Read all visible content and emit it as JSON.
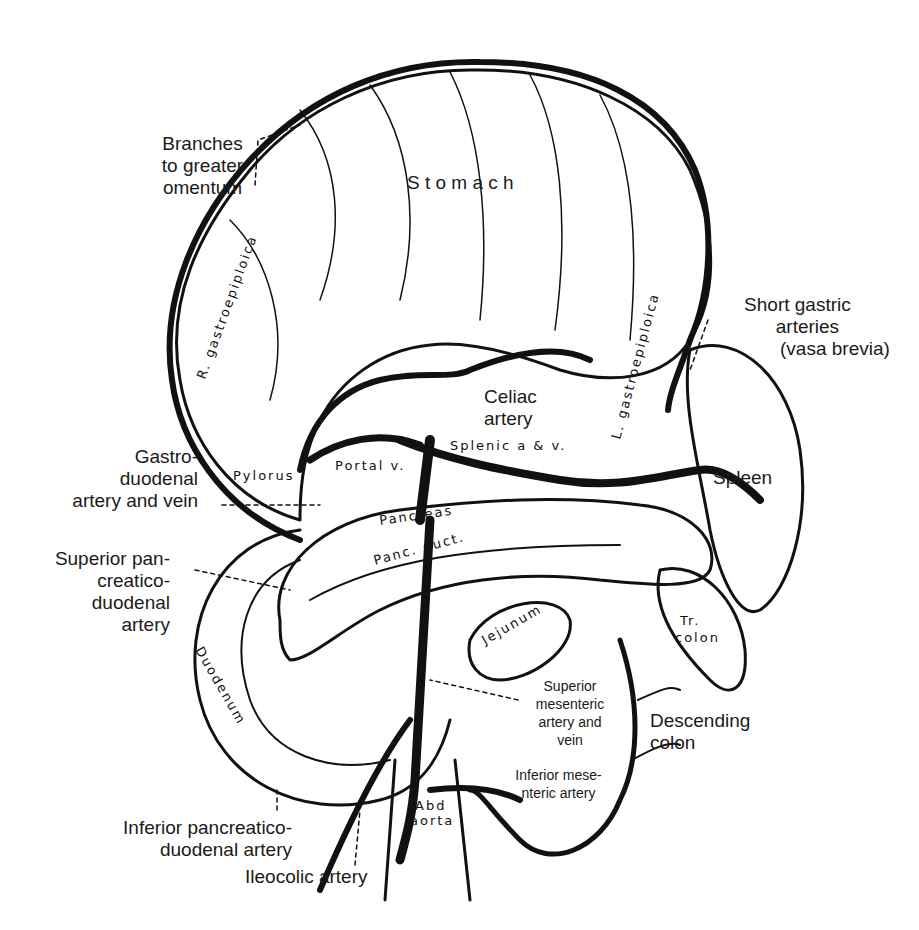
{
  "figure": {
    "type": "anatomical illustration"
  },
  "labels": {
    "stomach": "S t o m a c h",
    "branches_omentum": [
      "Branches",
      "to greater",
      "omentum"
    ],
    "short_gastric": [
      "Short gastric",
      "arteries",
      "(vasa brevia)"
    ],
    "celiac": [
      "Celiac",
      "artery"
    ],
    "gastroduodenal": [
      "Gastro-",
      "duodenal",
      "artery and vein"
    ],
    "spleen": "Spleen",
    "sup_pancreatico": [
      "Superior pan-",
      "creatico-",
      "duodenal",
      "artery"
    ],
    "sup_mesenteric": [
      "Superior",
      "mesenteric",
      "artery and",
      "vein"
    ],
    "descending_colon": [
      "Descending",
      "colon"
    ],
    "inf_mesenteric": [
      "Inferior mese-",
      "nteric artery"
    ],
    "inf_pancreatico": [
      "Inferior pancreatico-",
      "duodenal artery"
    ],
    "ileocolic": "Ileocolic artery"
  },
  "inline_labels": {
    "r_gastroepiploica": "R. gastroepiploica",
    "l_gastrica": "L. gastrica",
    "l_gastroepiploica": "L. gastroepiploica",
    "splenic": "Splenic a & v.",
    "hepatica": "Hepatica",
    "pylorus": "Pylorus",
    "portal_v": "Portal v.",
    "pancreas": "Pancreas",
    "panc_duct": "Panc. duct.",
    "jejunum": "Jejunum",
    "tr_colon": "Tr. colon",
    "duodenum": "Duodenum",
    "abd_aorta": "Abd. aorta"
  },
  "colors": {
    "ink": "#111111",
    "text": "#1a1a1a",
    "background": "#ffffff"
  }
}
